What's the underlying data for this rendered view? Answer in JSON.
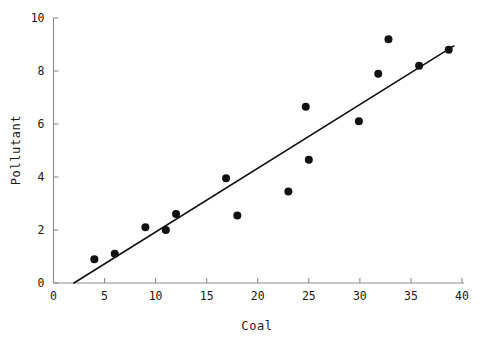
{
  "chart_data": {
    "type": "scatter",
    "title": "",
    "xlabel": "Coal",
    "ylabel": "Pollutant",
    "xlim": [
      0,
      40
    ],
    "ylim": [
      0,
      10
    ],
    "xticks": [
      0,
      5,
      10,
      15,
      20,
      25,
      30,
      35,
      40
    ],
    "yticks": [
      0,
      2,
      4,
      6,
      8,
      10
    ],
    "xticklabels": [
      "0",
      "5",
      "10",
      "15",
      "20",
      "25",
      "30",
      "35",
      "40"
    ],
    "yticklabels": [
      "0",
      "2",
      "4",
      "6",
      "8",
      "10"
    ],
    "grid": false,
    "legend": null,
    "marker": {
      "shape": "circle",
      "color": "#111111",
      "size_px": 8
    },
    "points": [
      {
        "x": 4.0,
        "y": 0.9
      },
      {
        "x": 6.0,
        "y": 1.1
      },
      {
        "x": 9.0,
        "y": 2.1
      },
      {
        "x": 11.0,
        "y": 2.0
      },
      {
        "x": 12.0,
        "y": 2.6
      },
      {
        "x": 16.9,
        "y": 3.95
      },
      {
        "x": 18.0,
        "y": 2.55
      },
      {
        "x": 23.0,
        "y": 3.45
      },
      {
        "x": 24.7,
        "y": 6.65
      },
      {
        "x": 25.0,
        "y": 4.65
      },
      {
        "x": 29.9,
        "y": 6.1
      },
      {
        "x": 31.8,
        "y": 7.9
      },
      {
        "x": 32.8,
        "y": 9.2
      },
      {
        "x": 35.8,
        "y": 8.2
      },
      {
        "x": 38.7,
        "y": 8.8
      }
    ],
    "fit_line": {
      "type": "linear",
      "color": "#111111",
      "x_start": 2.0,
      "y_start": 0.0,
      "x_end": 39.2,
      "y_end": 8.95,
      "slope": 0.2406,
      "intercept": -0.4812
    },
    "axis_color": "#8c8c8c",
    "background": "#ffffff"
  }
}
